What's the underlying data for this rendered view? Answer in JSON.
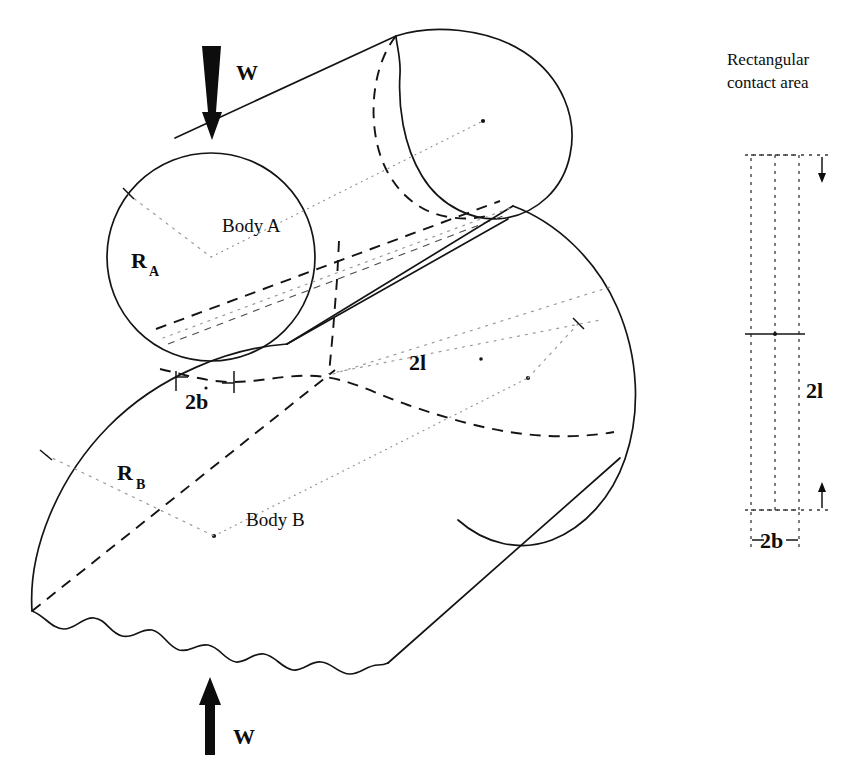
{
  "figure": {
    "title_alt": "Hertzian line contact between two parallel cylinders",
    "labels": {
      "load_top": "W",
      "load_bottom": "W",
      "body_a": "Body A",
      "body_b": "Body B",
      "radius_a": "R",
      "radius_a_sub": "A",
      "radius_b": "R",
      "radius_b_sub": "B",
      "half_width": "2b",
      "half_length": "2l"
    }
  },
  "inset": {
    "caption_line1": "Rectangular",
    "caption_line2": "contact area",
    "length_label": "2l",
    "width_label": "2b"
  },
  "colors": {
    "ink": "#141414",
    "hidden_line": "#4a4a4a",
    "center_line": "#8a8a8a",
    "paper": "#ffffff"
  }
}
